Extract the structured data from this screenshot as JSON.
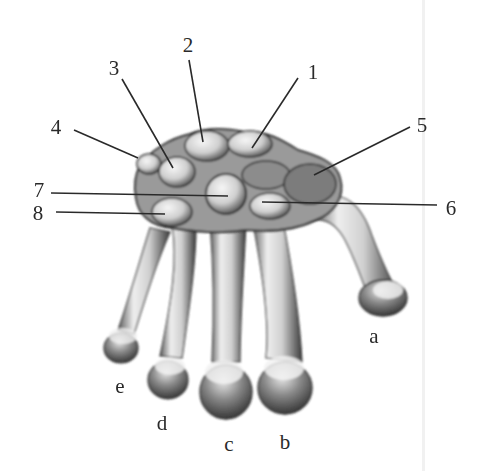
{
  "figure": {
    "type": "anatomical illustration",
    "colors": {
      "background": "#ffffff",
      "ink": "#2a2a2a",
      "bone_light": "#e9e9e9",
      "bone_shadow": "#3a3a3a",
      "divider": "#f1f1f1"
    },
    "number_labels": [
      {
        "text": "1",
        "x": 313,
        "y": 72
      },
      {
        "text": "2",
        "x": 188,
        "y": 45
      },
      {
        "text": "3",
        "x": 114,
        "y": 68
      },
      {
        "text": "4",
        "x": 56,
        "y": 127
      },
      {
        "text": "5",
        "x": 422,
        "y": 125
      },
      {
        "text": "6",
        "x": 451,
        "y": 208
      },
      {
        "text": "7",
        "x": 39,
        "y": 190
      },
      {
        "text": "8",
        "x": 38,
        "y": 213
      }
    ],
    "letter_labels": [
      {
        "text": "a",
        "x": 374,
        "y": 336
      },
      {
        "text": "b",
        "x": 285,
        "y": 442
      },
      {
        "text": "c",
        "x": 229,
        "y": 444
      },
      {
        "text": "d",
        "x": 162,
        "y": 423
      },
      {
        "text": "e",
        "x": 120,
        "y": 386
      }
    ]
  }
}
